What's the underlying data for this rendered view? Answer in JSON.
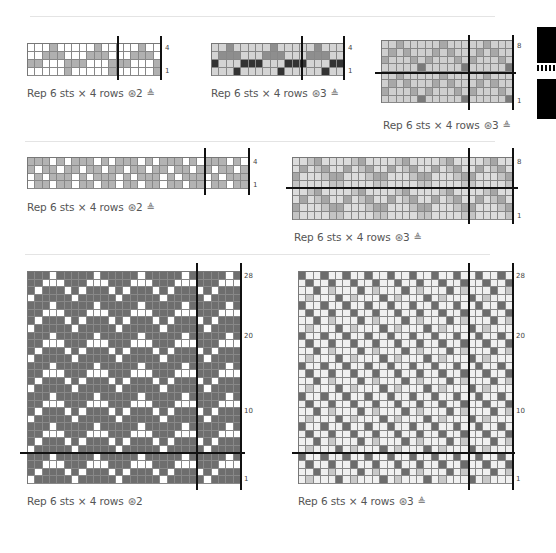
{
  "colors": {
    "white": "#ffffff",
    "light": "#d9d9d9",
    "mid": "#a8a8a8",
    "dark": "#6a6a6a",
    "black": "#2a2a2a"
  },
  "dividers": [
    {
      "x": 30,
      "y": 16,
      "w": 465
    },
    {
      "x": 25,
      "y": 141,
      "w": 470
    },
    {
      "x": 25,
      "y": 254,
      "w": 465
    }
  ],
  "charts": [
    {
      "id": "chart-a",
      "x": 27,
      "y": 43,
      "cols": 18,
      "rows": 4,
      "cw": 7.4,
      "ch": 7.9,
      "palette": [
        "#ffffff",
        "#b0b0b0"
      ],
      "pattern": [
        "000100",
        "001110",
        "110001",
        "000001"
      ],
      "vlines": [
        {
          "x": 117,
          "y1": 36,
          "y2": 80
        },
        {
          "x": 160,
          "y1": 36,
          "y2": 80
        }
      ],
      "hlines": [],
      "row_labels": [
        {
          "text": "4",
          "x": 165,
          "y": 44
        },
        {
          "text": "1",
          "x": 165,
          "y": 67
        }
      ],
      "caption": {
        "text": "Rep 6 sts × 4 rows",
        "colors": "2",
        "x": 27,
        "y": 87,
        "icons": [
          "yarn-colors-icon",
          "needle-icon"
        ]
      }
    },
    {
      "id": "chart-b",
      "x": 211,
      "y": 43,
      "cols": 18,
      "rows": 4,
      "cw": 7.35,
      "ch": 7.9,
      "palette": [
        "#d4d4d4",
        "#8e8e8e",
        "#333333"
      ],
      "pattern": [
        "001000",
        "011100",
        "200022",
        "000200"
      ],
      "vlines": [
        {
          "x": 301,
          "y1": 36,
          "y2": 80
        },
        {
          "x": 343,
          "y1": 36,
          "y2": 80
        }
      ],
      "hlines": [],
      "row_labels": [
        {
          "text": "4",
          "x": 348,
          "y": 44
        },
        {
          "text": "1",
          "x": 348,
          "y": 67
        }
      ],
      "caption": {
        "text": "Rep 6 sts × 4 rows",
        "colors": "3",
        "x": 211,
        "y": 87,
        "icons": [
          "yarn-colors-icon",
          "needle-icon"
        ]
      }
    },
    {
      "id": "chart-c",
      "x": 381,
      "y": 40,
      "cols": 18,
      "rows": 8,
      "cw": 7.3,
      "ch": 7.8,
      "palette": [
        "#cfcfcf",
        "#7a7a7a",
        "#a8a8a8"
      ],
      "pattern": [
        "002000",
        "020200",
        "200020",
        "000001",
        "002000",
        "020200",
        "200020",
        "000001"
      ],
      "vlines": [
        {
          "x": 468,
          "y1": 35,
          "y2": 110
        },
        {
          "x": 512,
          "y1": 35,
          "y2": 110
        }
      ],
      "hlines": [
        {
          "y": 72,
          "x1": 375,
          "x2": 516
        }
      ],
      "row_labels": [
        {
          "text": "8",
          "x": 517,
          "y": 42
        },
        {
          "text": "1",
          "x": 517,
          "y": 97
        }
      ],
      "caption": {
        "text": "Rep 6 sts × 4 rows",
        "colors": "3",
        "x": 383,
        "y": 119,
        "icons": [
          "yarn-colors-icon",
          "needle-icon"
        ]
      }
    },
    {
      "id": "chart-d",
      "x": 27,
      "y": 157,
      "cols": 30,
      "rows": 4,
      "cw": 7.37,
      "ch": 7.8,
      "palette": [
        "#ffffff",
        "#b3b3b3"
      ],
      "pattern": [
        "111010",
        "101101",
        "010111",
        "011011"
      ],
      "vlines": [
        {
          "x": 204,
          "y1": 148,
          "y2": 195
        },
        {
          "x": 248,
          "y1": 148,
          "y2": 195
        }
      ],
      "hlines": [],
      "row_labels": [
        {
          "text": "4",
          "x": 253,
          "y": 158
        },
        {
          "text": "1",
          "x": 253,
          "y": 181
        }
      ],
      "caption": {
        "text": "Rep 6 sts × 4 rows",
        "colors": "2",
        "x": 27,
        "y": 201,
        "icons": [
          "yarn-colors-icon",
          "needle-icon"
        ]
      }
    },
    {
      "id": "chart-e",
      "x": 292,
      "y": 157,
      "cols": 30,
      "rows": 8,
      "cw": 7.33,
      "ch": 7.7,
      "palette": [
        "#dcdcdc",
        "#a6a6a6",
        "#c4c4c4"
      ],
      "pattern": [
        "002100",
        "010210",
        "100021",
        "200002",
        "002100",
        "010210",
        "100021",
        "200002"
      ],
      "vlines": [
        {
          "x": 468,
          "y1": 148,
          "y2": 224
        },
        {
          "x": 512,
          "y1": 148,
          "y2": 224
        }
      ],
      "hlines": [
        {
          "y": 187,
          "x1": 286,
          "x2": 518
        }
      ],
      "row_labels": [
        {
          "text": "8",
          "x": 517,
          "y": 158
        },
        {
          "text": "1",
          "x": 517,
          "y": 212
        }
      ],
      "caption": {
        "text": "Rep 6 sts × 4 rows",
        "colors": "3",
        "x": 294,
        "y": 231,
        "icons": [
          "yarn-colors-icon",
          "needle-icon"
        ]
      }
    },
    {
      "id": "chart-f",
      "x": 27,
      "y": 271,
      "cols": 29,
      "rows": 28,
      "cw": 7.35,
      "ch": 7.57,
      "palette": [
        "#ffffff",
        "#6e6e6e"
      ],
      "pattern": [
        "111011",
        "110001",
        "101110",
        "011111"
      ],
      "vlines": [
        {
          "x": 196,
          "y1": 263,
          "y2": 490
        },
        {
          "x": 240,
          "y1": 263,
          "y2": 490
        }
      ],
      "hlines": [
        {
          "y": 452,
          "x1": 20,
          "x2": 245
        }
      ],
      "row_labels": [
        {
          "text": "28",
          "x": 244,
          "y": 272
        },
        {
          "text": "20",
          "x": 244,
          "y": 332
        },
        {
          "text": "10",
          "x": 244,
          "y": 407
        },
        {
          "text": "1",
          "x": 244,
          "y": 475
        }
      ],
      "caption": {
        "text": "Rep 6 sts × 4 rows",
        "colors": "2",
        "x": 27,
        "y": 495,
        "icons": [
          "yarn-colors-icon"
        ]
      }
    },
    {
      "id": "chart-g",
      "x": 298,
      "y": 271,
      "cols": 29,
      "rows": 28,
      "cw": 7.38,
      "ch": 7.57,
      "palette": [
        "#f0f0f0",
        "#6c6c6c",
        "#c8c8c8"
      ],
      "pattern": [
        "100100",
        "010010",
        "001020",
        "020001"
      ],
      "vlines": [
        {
          "x": 468,
          "y1": 263,
          "y2": 490
        },
        {
          "x": 512,
          "y1": 263,
          "y2": 490
        }
      ],
      "hlines": [
        {
          "y": 452,
          "x1": 292,
          "x2": 515
        }
      ],
      "row_labels": [
        {
          "text": "28",
          "x": 516,
          "y": 272
        },
        {
          "text": "20",
          "x": 516,
          "y": 332
        },
        {
          "text": "10",
          "x": 516,
          "y": 407
        },
        {
          "text": "1",
          "x": 516,
          "y": 475
        }
      ],
      "caption": {
        "text": "Rep 6 sts × 4 rows",
        "colors": "3",
        "x": 298,
        "y": 495,
        "icons": [
          "yarn-colors-icon",
          "needle-icon"
        ]
      }
    }
  ],
  "side_tabs": [
    {
      "name": "chapter-tab-stripes",
      "x": 537,
      "y": 27,
      "w": 19,
      "h": 36
    },
    {
      "name": "chapter-tab-icon",
      "x": 537,
      "y": 79,
      "w": 19,
      "h": 40
    }
  ],
  "icons": {
    "yarn-colors-icon": "㊫",
    "needle-icon": "⩝"
  }
}
